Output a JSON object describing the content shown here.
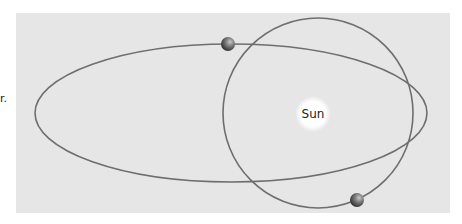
{
  "diagram": {
    "edge_text": "r.",
    "sun": {
      "label": "Sun",
      "cx": 313,
      "cy": 114,
      "r": 14
    },
    "elliptical_orbit": {
      "cx": 231,
      "cy": 113,
      "rx": 196,
      "ry": 69
    },
    "circular_orbit": {
      "cx": 318,
      "cy": 113,
      "r": 95
    },
    "planets": [
      {
        "name": "planet-on-elliptical-orbit",
        "cx": 228,
        "cy": 44,
        "r": 7
      },
      {
        "name": "planet-on-circular-orbit",
        "cx": 357,
        "cy": 200,
        "r": 7
      }
    ],
    "colors": {
      "panel": "#e6e6e6",
      "orbit_line": "#6e6e6e",
      "sun_glow": "#ffffff",
      "planet_dark": "#3a3a3a",
      "planet_light": "#b0b0b0"
    }
  }
}
